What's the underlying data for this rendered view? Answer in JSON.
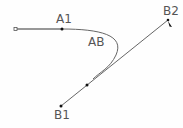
{
  "diagram": {
    "labels": {
      "a1": "A1",
      "ab": "AB",
      "b1": "B1",
      "b2": "B2"
    },
    "colors": {
      "stroke": "#666666",
      "stroke_dark": "#333333",
      "text": "#555555",
      "point": "#111111"
    },
    "points": {
      "start": [
        16,
        29
      ],
      "a1": [
        62,
        29
      ],
      "b1": [
        61,
        106
      ],
      "mid": [
        87,
        85
      ],
      "b2": [
        168,
        20
      ]
    }
  }
}
